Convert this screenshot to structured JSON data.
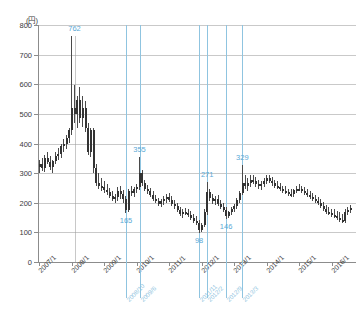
{
  "chart_data": {
    "type": "line",
    "subtype": "candlestick",
    "title": "",
    "unit_label": "(円)",
    "xlabel": "",
    "ylabel": "",
    "ylim": [
      0,
      800
    ],
    "ytick_step": 100,
    "yticks": [
      0,
      100,
      200,
      300,
      400,
      500,
      600,
      700,
      800
    ],
    "grid": true,
    "grid_axis": "y",
    "legend": "none",
    "x_range": [
      "2007/1",
      "2016/11"
    ],
    "x_tick_labels": [
      "2007/1",
      "2008/1",
      "2009/1",
      "2010/1",
      "2011/1",
      "2012/1",
      "2013/1",
      "2014/1",
      "2015/1",
      "2016/1"
    ],
    "x_tick_indices": [
      0,
      12,
      24,
      36,
      48,
      60,
      72,
      84,
      96,
      108
    ],
    "annotations": [
      {
        "label": "762",
        "value": 762,
        "index": 13,
        "kind": "high"
      },
      {
        "label": "165",
        "value": 165,
        "index": 32,
        "kind": "low",
        "marker_date": "2008/10"
      },
      {
        "label": "355",
        "value": 355,
        "index": 37,
        "kind": "high",
        "marker_date": "2009/6"
      },
      {
        "label": "98",
        "value": 98,
        "index": 59,
        "kind": "low",
        "marker_date": "2011/11"
      },
      {
        "label": "271",
        "value": 271,
        "index": 62,
        "kind": "high",
        "marker_date": "2012/2"
      },
      {
        "label": "146",
        "value": 146,
        "index": 69,
        "kind": "low",
        "marker_date": "2012/9"
      },
      {
        "label": "329",
        "value": 329,
        "index": 75,
        "kind": "high",
        "marker_date": "2013/3"
      }
    ],
    "marker_dates": [
      "2008/10",
      "2009/6",
      "2011/11",
      "2012/2",
      "2012/9",
      "2013/3"
    ],
    "marker_indices": [
      32,
      37,
      59,
      62,
      69,
      75
    ],
    "colors": {
      "annotation": "#5aa9d6",
      "marker_line": "#8fc4e0",
      "grid": "#c9c9c9",
      "axis": "#8c8c8c",
      "candle_up": "#ffffff",
      "candle_down": "#333333",
      "candle_wick": "#4a4a4a",
      "tick_text": "#3a3a3a"
    },
    "series": [
      {
        "name": "monthly-ohlc",
        "ohlc": [
          [
            320,
            345,
            300,
            330
          ],
          [
            330,
            352,
            308,
            318
          ],
          [
            318,
            360,
            305,
            352
          ],
          [
            352,
            372,
            330,
            338
          ],
          [
            338,
            358,
            312,
            322
          ],
          [
            322,
            345,
            300,
            340
          ],
          [
            340,
            372,
            330,
            358
          ],
          [
            358,
            385,
            344,
            366
          ],
          [
            366,
            398,
            352,
            392
          ],
          [
            392,
            415,
            370,
            398
          ],
          [
            398,
            430,
            382,
            420
          ],
          [
            420,
            452,
            400,
            446
          ],
          [
            446,
            762,
            430,
            520
          ],
          [
            520,
            598,
            468,
            500
          ],
          [
            500,
            560,
            452,
            548
          ],
          [
            548,
            592,
            470,
            486
          ],
          [
            486,
            560,
            455,
            520
          ],
          [
            520,
            545,
            438,
            452
          ],
          [
            452,
            470,
            360,
            372
          ],
          [
            372,
            452,
            355,
            444
          ],
          [
            444,
            452,
            300,
            318
          ],
          [
            318,
            332,
            258,
            268
          ],
          [
            268,
            300,
            245,
            258
          ],
          [
            258,
            285,
            238,
            252
          ],
          [
            252,
            275,
            232,
            244
          ],
          [
            244,
            262,
            225,
            236
          ],
          [
            236,
            250,
            215,
            222
          ],
          [
            222,
            238,
            205,
            212
          ],
          [
            212,
            230,
            198,
            218
          ],
          [
            218,
            252,
            205,
            240
          ],
          [
            240,
            258,
            212,
            228
          ],
          [
            228,
            242,
            200,
            212
          ],
          [
            212,
            222,
            165,
            176
          ],
          [
            176,
            248,
            170,
            238
          ],
          [
            238,
            255,
            222,
            232
          ],
          [
            232,
            252,
            220,
            245
          ],
          [
            245,
            262,
            232,
            252
          ],
          [
            252,
            355,
            242,
            300
          ],
          [
            300,
            312,
            255,
            265
          ],
          [
            265,
            278,
            238,
            248
          ],
          [
            248,
            260,
            228,
            238
          ],
          [
            238,
            250,
            218,
            226
          ],
          [
            226,
            238,
            206,
            212
          ],
          [
            212,
            225,
            198,
            206
          ],
          [
            206,
            216,
            188,
            196
          ],
          [
            196,
            212,
            185,
            205
          ],
          [
            205,
            222,
            192,
            212
          ],
          [
            212,
            228,
            198,
            218
          ],
          [
            218,
            232,
            202,
            210
          ],
          [
            210,
            222,
            188,
            196
          ],
          [
            196,
            208,
            180,
            188
          ],
          [
            188,
            198,
            168,
            175
          ],
          [
            175,
            185,
            155,
            162
          ],
          [
            162,
            178,
            148,
            170
          ],
          [
            170,
            182,
            158,
            165
          ],
          [
            165,
            178,
            152,
            160
          ],
          [
            160,
            172,
            142,
            150
          ],
          [
            150,
            162,
            132,
            140
          ],
          [
            140,
            155,
            125,
            132
          ],
          [
            132,
            142,
            98,
            108
          ],
          [
            108,
            132,
            100,
            125
          ],
          [
            125,
            180,
            118,
            168
          ],
          [
            168,
            271,
            160,
            235
          ],
          [
            235,
            248,
            205,
            215
          ],
          [
            215,
            228,
            196,
            205
          ],
          [
            205,
            222,
            192,
            212
          ],
          [
            212,
            225,
            188,
            196
          ],
          [
            196,
            210,
            178,
            186
          ],
          [
            186,
            198,
            168,
            175
          ],
          [
            175,
            185,
            146,
            155
          ],
          [
            155,
            172,
            150,
            168
          ],
          [
            168,
            185,
            160,
            178
          ],
          [
            178,
            195,
            168,
            188
          ],
          [
            188,
            215,
            180,
            208
          ],
          [
            208,
            240,
            198,
            232
          ],
          [
            232,
            329,
            225,
            268
          ],
          [
            268,
            295,
            245,
            258
          ],
          [
            258,
            282,
            238,
            268
          ],
          [
            268,
            292,
            252,
            278
          ],
          [
            278,
            295,
            262,
            272
          ],
          [
            272,
            288,
            252,
            262
          ],
          [
            262,
            278,
            245,
            255
          ],
          [
            255,
            272,
            242,
            262
          ],
          [
            262,
            285,
            252,
            275
          ],
          [
            275,
            292,
            262,
            282
          ],
          [
            282,
            295,
            268,
            275
          ],
          [
            275,
            288,
            258,
            265
          ],
          [
            265,
            278,
            250,
            258
          ],
          [
            258,
            272,
            245,
            252
          ],
          [
            252,
            265,
            238,
            245
          ],
          [
            245,
            258,
            232,
            240
          ],
          [
            240,
            255,
            228,
            235
          ],
          [
            235,
            248,
            222,
            230
          ],
          [
            230,
            245,
            218,
            228
          ],
          [
            228,
            248,
            220,
            242
          ],
          [
            242,
            258,
            232,
            248
          ],
          [
            248,
            262,
            238,
            245
          ],
          [
            245,
            258,
            232,
            240
          ],
          [
            240,
            252,
            225,
            232
          ],
          [
            232,
            245,
            218,
            225
          ],
          [
            225,
            238,
            212,
            220
          ],
          [
            220,
            232,
            205,
            212
          ],
          [
            212,
            225,
            198,
            205
          ],
          [
            205,
            218,
            192,
            198
          ],
          [
            198,
            212,
            182,
            190
          ],
          [
            190,
            202,
            172,
            178
          ],
          [
            178,
            192,
            162,
            170
          ],
          [
            170,
            185,
            158,
            166
          ],
          [
            166,
            180,
            152,
            160
          ],
          [
            160,
            178,
            148,
            155
          ],
          [
            155,
            172,
            142,
            150
          ],
          [
            150,
            168,
            135,
            142
          ],
          [
            142,
            162,
            130,
            138
          ],
          [
            138,
            178,
            132,
            168
          ],
          [
            168,
            185,
            158,
            175
          ],
          [
            175,
            192,
            165,
            182
          ]
        ]
      }
    ]
  }
}
